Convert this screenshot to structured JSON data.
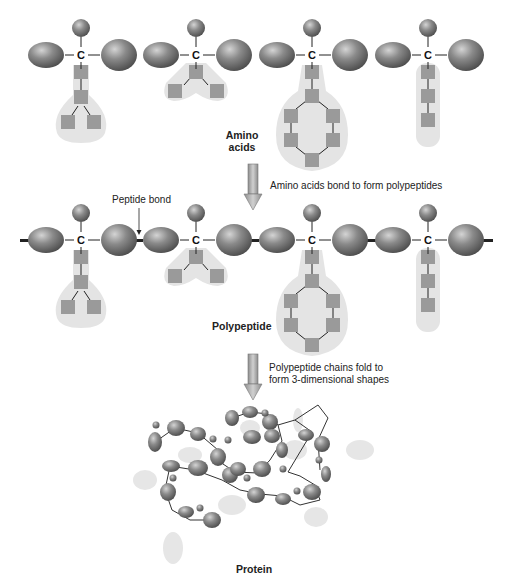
{
  "labels": {
    "amino_acids_line1": "Amino",
    "amino_acids_line2": "acids",
    "step1_caption": "Amino acids bond to form polypeptides",
    "peptide_bond": "Peptide bond",
    "polypeptide": "Polypeptide",
    "step2_caption_line1": "Polypeptide chains fold to",
    "step2_caption_line2": "form 3-dimensional shapes",
    "protein": "Protein",
    "carbon_symbol": "C"
  },
  "colors": {
    "sphere_dark": "#6e6e6e",
    "sphere_light": "#bdbdbd",
    "side_chain_bg": "#e4e4e4",
    "side_chain_square": "#9a9a9a",
    "arrow_fill": "#b0b0b0",
    "bond_line": "#222222"
  },
  "amino_acids": [
    {
      "id": 1,
      "side_chain": "branched-3"
    },
    {
      "id": 2,
      "side_chain": "v-branched"
    },
    {
      "id": 3,
      "side_chain": "ring"
    },
    {
      "id": 4,
      "side_chain": "linear-3"
    }
  ]
}
